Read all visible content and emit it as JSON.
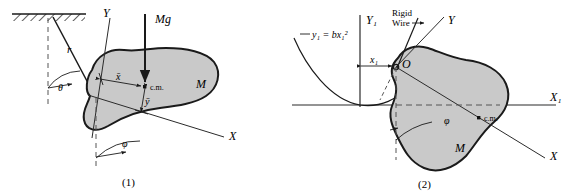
{
  "figure": {
    "type": "physics-mechanics-diagram",
    "panels": [
      {
        "caption": "(1)",
        "description": "Rigid body suspended as a compound pendulum from a fixed ceiling",
        "labels": {
          "r": "r",
          "theta": "θ",
          "phi": "φ",
          "axis_y": "Y",
          "axis_x": "X",
          "weight": "Mg",
          "body": "M",
          "center_of_mass": "c.m.",
          "x_bar": "x̄",
          "y_bar": "ȳ"
        }
      },
      {
        "caption": "(2)",
        "description": "Rigid body attached by a rigid wire to a bead sliding on a parabolic track",
        "labels": {
          "curve_equation": "y₁ = bx₁²",
          "rigid_wire": "Rigid\nWire",
          "rigid_wire_line1": "Rigid",
          "rigid_wire_line2": "Wire",
          "axis_y1": "Y₁",
          "axis_x1": "X₁",
          "axis_y": "Y",
          "axis_x": "X",
          "origin": "O",
          "x1": "x₁",
          "phi": "φ",
          "body": "M",
          "center_of_mass": "c.m."
        }
      }
    ],
    "colors": {
      "body_fill": "#c9c9c9",
      "outline": "#1a1a1a",
      "line": "#2b2b2b",
      "background": "#ffffff"
    }
  }
}
